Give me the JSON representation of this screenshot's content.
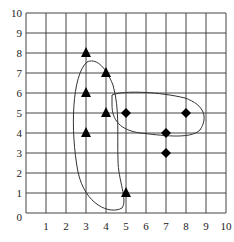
{
  "chart_data": {
    "type": "scatter",
    "title": "",
    "xlabel": "",
    "ylabel": "",
    "xlim": [
      0,
      10
    ],
    "ylim": [
      0,
      10
    ],
    "grid": true,
    "x_ticks": [
      "1",
      "2",
      "3",
      "4",
      "5",
      "6",
      "7",
      "8",
      "9",
      "10"
    ],
    "y_ticks": [
      "0",
      "1",
      "2",
      "3",
      "4",
      "5",
      "6",
      "7",
      "8",
      "9",
      "10"
    ],
    "origin_label": "0",
    "series": [
      {
        "name": "triangles",
        "marker": "triangle",
        "color": "#000000",
        "points": [
          [
            3,
            8
          ],
          [
            4,
            7
          ],
          [
            3,
            6
          ],
          [
            4,
            5
          ],
          [
            3,
            4
          ],
          [
            5,
            1
          ]
        ]
      },
      {
        "name": "diamonds",
        "marker": "diamond",
        "color": "#000000",
        "points": [
          [
            5,
            5
          ],
          [
            7,
            4
          ],
          [
            8,
            5
          ],
          [
            7,
            3
          ]
        ]
      }
    ],
    "clusters": [
      {
        "name": "triangle-cluster-outline",
        "members": "triangles"
      },
      {
        "name": "diamond-cluster-outline",
        "members": "diamonds"
      }
    ]
  }
}
